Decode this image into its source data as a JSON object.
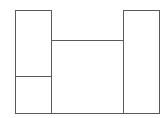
{
  "diagram": {
    "type": "floor-plan-outline",
    "stroke_color": "#5a5a5a",
    "background": "#ffffff",
    "shapes": [
      {
        "name": "left-box",
        "x": 15,
        "y": 10,
        "w": 37,
        "h": 104
      },
      {
        "name": "left-box-divider",
        "x": 15,
        "y": 76,
        "w": 37
      },
      {
        "name": "center-box",
        "x": 51,
        "y": 40,
        "w": 73,
        "h": 74
      },
      {
        "name": "right-box",
        "x": 123,
        "y": 10,
        "w": 37,
        "h": 104
      }
    ],
    "labels": []
  }
}
